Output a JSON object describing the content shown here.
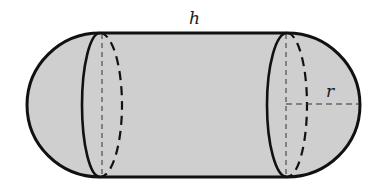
{
  "figure": {
    "labels": {
      "height": "h",
      "radius": "r"
    },
    "colors": {
      "fill": "#cfcfcf",
      "stroke": "#111111",
      "background": "#ffffff"
    }
  }
}
